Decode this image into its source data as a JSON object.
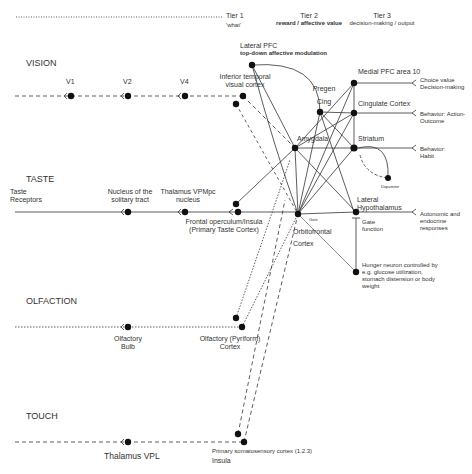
{
  "tiers": [
    {
      "title": "Tier 1",
      "subtitle": "'what'"
    },
    {
      "title": "Tier 2",
      "subtitle": "reward / affective value"
    },
    {
      "title": "Tier 3",
      "subtitle": "decision-making / output"
    }
  ],
  "modalities": {
    "vision": "VISION",
    "taste": "TASTE",
    "olfaction": "OLFACTION",
    "touch": "TOUCH"
  },
  "nodes": {
    "v1": "V1",
    "v2": "V2",
    "v4": "V4",
    "inferior_temporal": "Inferior temporal visual cortex",
    "lateral_pfc": "Lateral PFC",
    "lateral_pfc_sub": "top-down affective modulation",
    "taste_receptors": "Taste Receptors",
    "nucleus_solitary": "Nucleus of the solitary tract",
    "thalamus_vpmpc": "Thalamus VPMpc nucleus",
    "frontal_operculum": "Frontal operculum/Insula (Primary Taste Cortex)",
    "olfactory_bulb": "Olfactory Bulb",
    "olfactory_cortex": "Olfactory (Pyriform) Cortex",
    "thalamus_vpl": "Thalamus VPL",
    "somatosensory": "Primary somatosensory cortex (1.2.3)",
    "insula": "Insula",
    "pregen_cing": "Pregen Cing",
    "amygdala": "Amygdala",
    "orbitofrontal": "Orbitofrontal Cortex",
    "gate": "Gate",
    "medial_pfc": "Medial PFC area 10",
    "cingulate": "Cingulate Cortex",
    "striatum": "Striatum",
    "dopamine": "Dopamine",
    "lateral_hypothalamus": "Lateral Hypothalamus",
    "gate_function": "Gate function",
    "hunger_neuron": "Hunger neuron controlled by e.g. glucose utilization, stomach distension or body weight"
  },
  "outputs": {
    "choice": "Choice value Decision-making",
    "action_outcome": "Behavior: Action-Outcome",
    "habit": "Behavior: Habit",
    "autonomic": "Autonomic and endocrine responses"
  }
}
